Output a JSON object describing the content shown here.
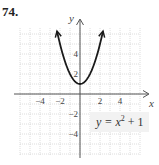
{
  "problem": {
    "number": "74."
  },
  "chart_data": {
    "type": "line",
    "title": "",
    "function": "y = x^2 + 1",
    "xlabel": "x",
    "ylabel": "y",
    "xlim": [
      -6,
      6
    ],
    "ylim": [
      -6,
      6.5
    ],
    "grid": true,
    "x_ticks": [
      {
        "value": -4,
        "label": "−4"
      },
      {
        "value": -2,
        "label": "−2"
      },
      {
        "value": 2,
        "label": "2"
      },
      {
        "value": 4,
        "label": "4"
      }
    ],
    "y_ticks": [
      {
        "value": 4,
        "label": "4"
      },
      {
        "value": 2,
        "label": "2"
      },
      {
        "value": -2,
        "label": "−2"
      },
      {
        "value": -4,
        "label": "−4"
      }
    ],
    "series": [
      {
        "name": "y = x^2 + 1",
        "x": [
          -2.3,
          -2,
          -1.5,
          -1,
          -0.5,
          0,
          0.5,
          1,
          1.5,
          2,
          2.3
        ],
        "values": [
          6.29,
          5,
          3.25,
          2,
          1.25,
          1,
          1.25,
          2,
          3.25,
          5,
          6.29
        ],
        "arrows_at_ends": true
      }
    ],
    "annotations": [
      {
        "text_main": "y = x",
        "superscript": "2",
        "text_tail": " + 1",
        "position": "lower-right"
      }
    ]
  }
}
